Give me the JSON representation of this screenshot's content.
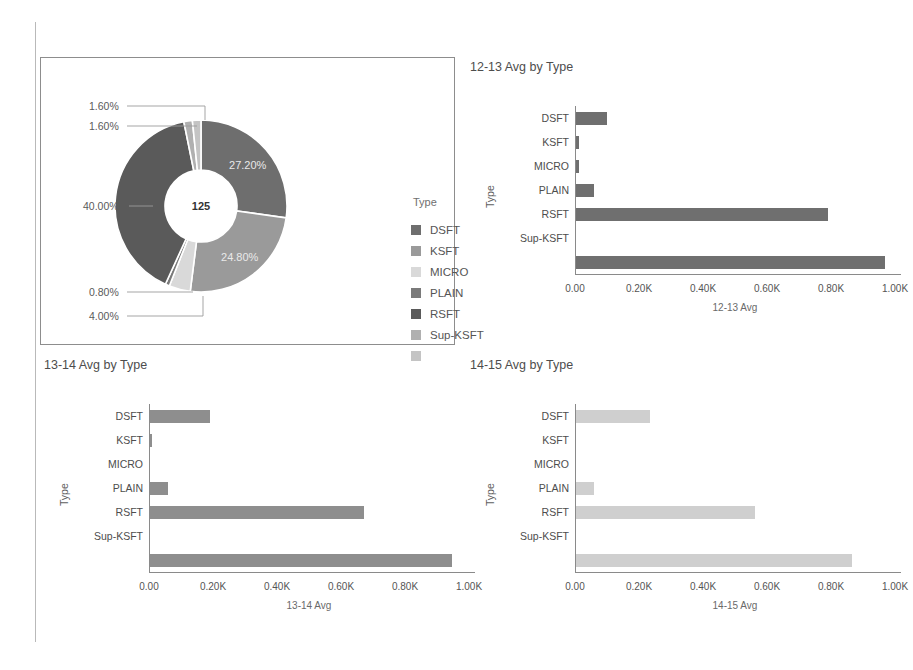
{
  "colors": {
    "dsft": "#6e6e6e",
    "ksft": "#9a9a9a",
    "micro": "#d9d9d9",
    "plain": "#7a7a7a",
    "rsft": "#5a5a5a",
    "supksft": "#b0b0b0",
    "blank": "#c4c4c4",
    "bar_dark": "#6f6f6f",
    "bar_mid": "#8e8e8e",
    "bar_light": "#cfcfcf",
    "axis": "#8a8a8a",
    "panel_border": "#8d8d8d"
  },
  "legend": {
    "title": "Type",
    "items": [
      {
        "label": "DSFT",
        "color": "#6e6e6e"
      },
      {
        "label": "KSFT",
        "color": "#9a9a9a"
      },
      {
        "label": "MICRO",
        "color": "#d9d9d9"
      },
      {
        "label": "PLAIN",
        "color": "#7a7a7a"
      },
      {
        "label": "RSFT",
        "color": "#5a5a5a"
      },
      {
        "label": "Sup-KSFT",
        "color": "#b0b0b0"
      },
      {
        "label": "",
        "color": "#c4c4c4"
      }
    ]
  },
  "chart_data": [
    {
      "type": "pie",
      "title": "",
      "center_label": "125",
      "legend_title": "Type",
      "legend_position": "right",
      "labels": [
        "DSFT",
        "KSFT",
        "MICRO",
        "PLAIN",
        "RSFT",
        "Sup-KSFT",
        ""
      ],
      "values": [
        27.2,
        24.8,
        4.0,
        0.8,
        40.0,
        1.6,
        1.6
      ],
      "value_labels": [
        "27.20%",
        "24.80%",
        "4.00%",
        "0.80%",
        "40.00%",
        "1.60%",
        "1.60%"
      ],
      "inside_labels": [
        "27.20%",
        "24.80%"
      ],
      "callout_labels": [
        "1.60%",
        "1.60%",
        "40.00%",
        "0.80%",
        "4.00%"
      ],
      "colors": [
        "#6e6e6e",
        "#9a9a9a",
        "#d9d9d9",
        "#7a7a7a",
        "#5a5a5a",
        "#b0b0b0",
        "#c4c4c4"
      ]
    },
    {
      "type": "bar",
      "orientation": "horizontal",
      "title": "12-13 Avg by Type",
      "xlabel": "12-13 Avg",
      "ylabel": "Type",
      "categories": [
        "DSFT",
        "KSFT",
        "MICRO",
        "PLAIN",
        "RSFT",
        "Sup-KSFT",
        ""
      ],
      "values": [
        97,
        8,
        8,
        56,
        787,
        0,
        967
      ],
      "xlim": [
        0,
        1000
      ],
      "ticks": [
        0,
        200,
        400,
        600,
        800,
        1000
      ],
      "tick_labels": [
        "0.00",
        "0.20K",
        "0.40K",
        "0.60K",
        "0.80K",
        "1.00K"
      ],
      "grid": false,
      "bar_color": "#6f6f6f"
    },
    {
      "type": "bar",
      "orientation": "horizontal",
      "title": "13-14 Avg by Type",
      "xlabel": "13-14 Avg",
      "ylabel": "Type",
      "categories": [
        "DSFT",
        "KSFT",
        "MICRO",
        "PLAIN",
        "RSFT",
        "Sup-KSFT",
        ""
      ],
      "values": [
        188,
        5,
        0,
        57,
        670,
        0,
        943
      ],
      "xlim": [
        0,
        1000
      ],
      "ticks": [
        0,
        200,
        400,
        600,
        800,
        1000
      ],
      "tick_labels": [
        "0.00",
        "0.20K",
        "0.40K",
        "0.60K",
        "0.80K",
        "1.00K"
      ],
      "grid": false,
      "bar_color": "#8e8e8e"
    },
    {
      "type": "bar",
      "orientation": "horizontal",
      "title": "14-15 Avg by Type",
      "xlabel": "14-15 Avg",
      "ylabel": "Type",
      "categories": [
        "DSFT",
        "KSFT",
        "MICRO",
        "PLAIN",
        "RSFT",
        "Sup-KSFT",
        ""
      ],
      "values": [
        232,
        0,
        0,
        55,
        560,
        0,
        862
      ],
      "xlim": [
        0,
        1000
      ],
      "ticks": [
        0,
        200,
        400,
        600,
        800,
        1000
      ],
      "tick_labels": [
        "0.00",
        "0.20K",
        "0.40K",
        "0.60K",
        "0.80K",
        "1.00K"
      ],
      "grid": false,
      "bar_color": "#cfcfcf"
    }
  ]
}
